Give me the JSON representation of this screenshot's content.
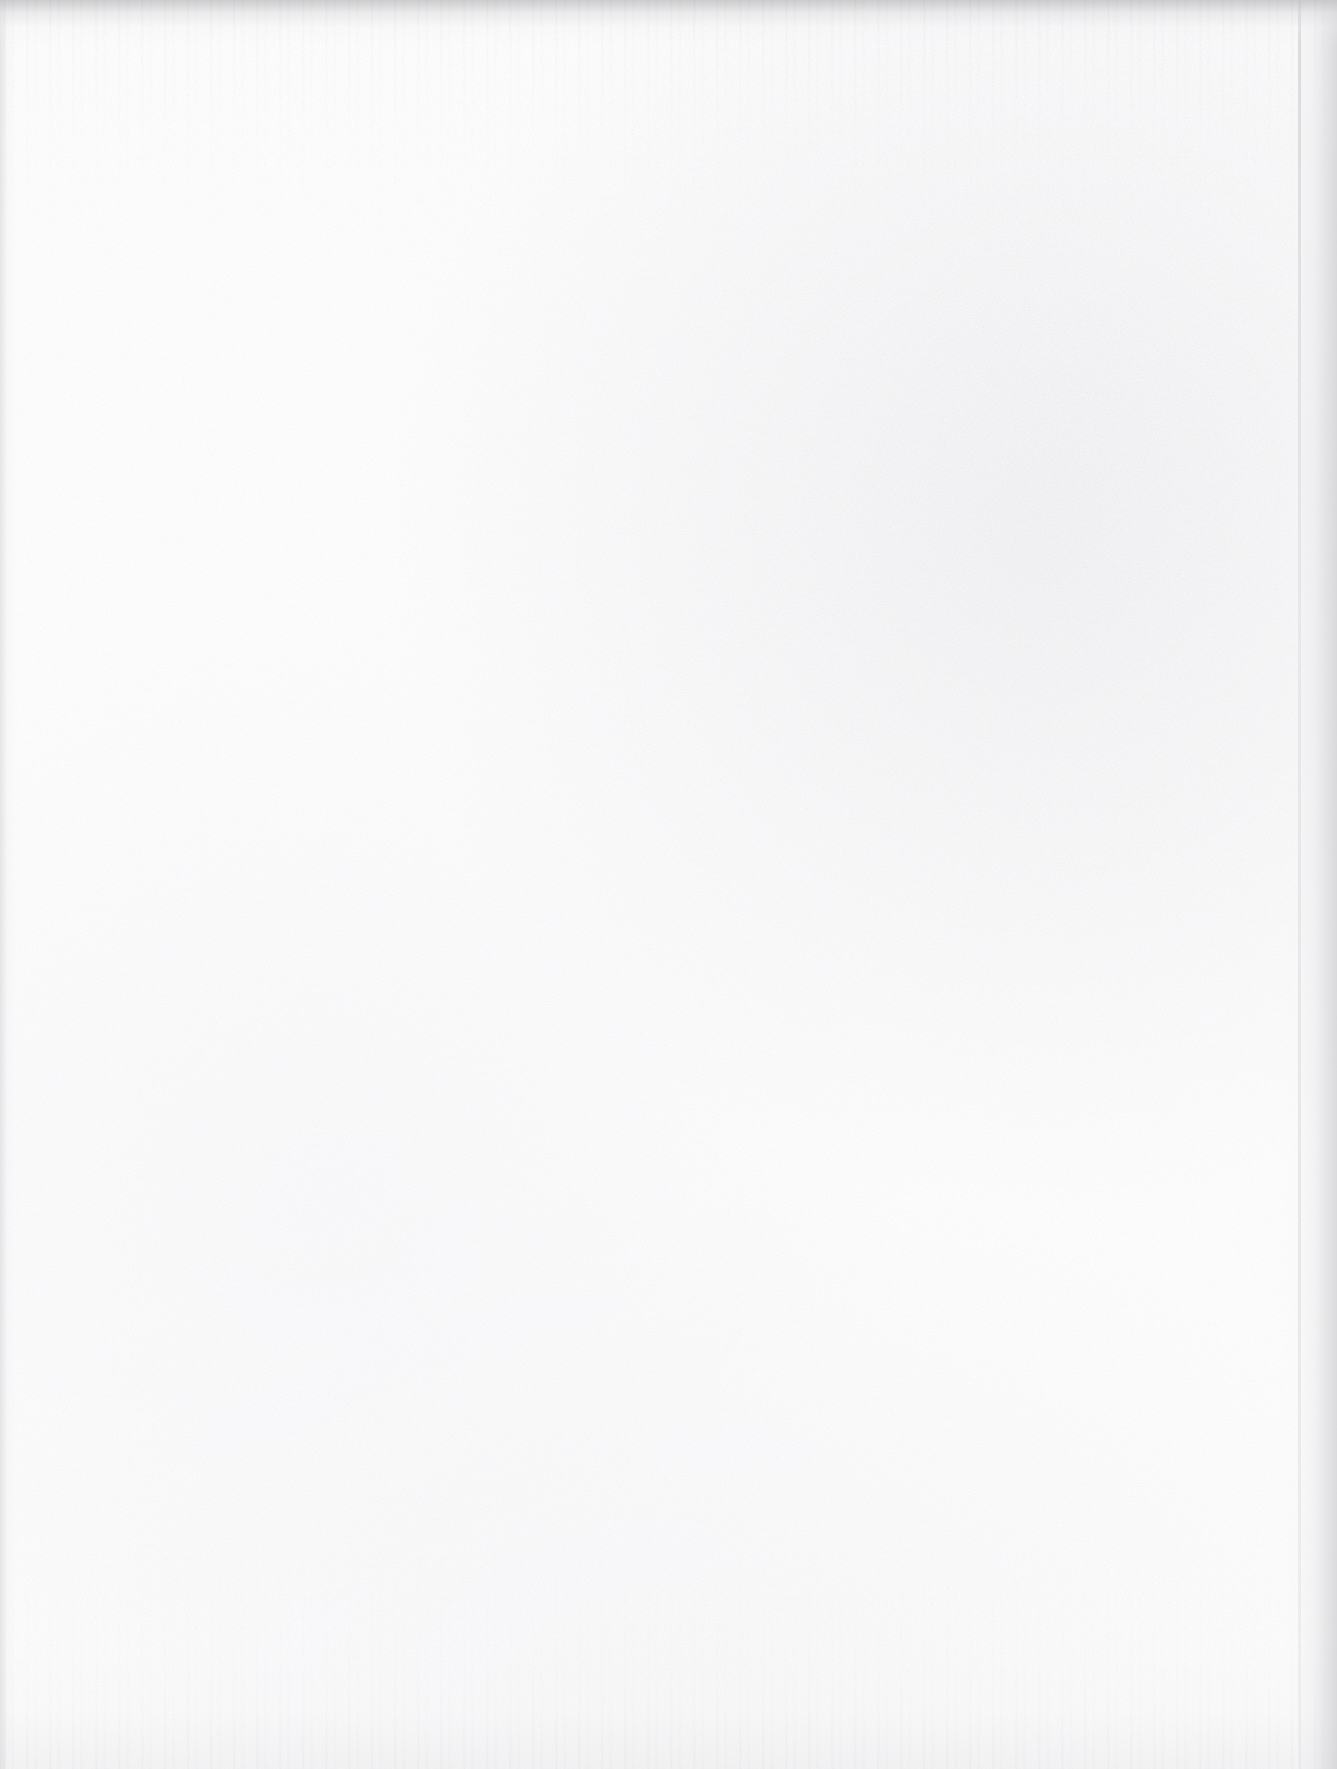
{
  "document": {
    "kind": "scanned-page",
    "page_state": "blank",
    "content_text": "",
    "width_px": 1337,
    "height_px": 1769,
    "orientation": "portrait"
  },
  "appearance": {
    "paper_color": "#fdfdfd",
    "page_base_tone": "#fcfcfc",
    "grain_color": "#e9e9ec",
    "top_edge_shadow_color": "#c4c4c6",
    "left_edge_shadow_color": "#d6d6d8",
    "right_edge_shadow_color": "#cecece",
    "right_edge_line_color": "#c6c6c9",
    "bottom_edge_shadow_color": "#ebebed"
  },
  "artifacts": {
    "top_band_label": "top edge scan shadow",
    "left_streak_label": "left edge vertical streak",
    "right_band_label": "right page-edge shadow",
    "right_line_label": "page edge line",
    "bottom_band_label": "bottom edge streaking",
    "grain_label": "paper speckle grain"
  }
}
